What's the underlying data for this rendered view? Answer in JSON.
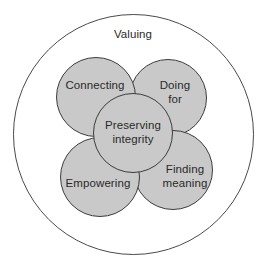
{
  "diagram": {
    "type": "nested-venn",
    "outer": {
      "label": "Valuing",
      "center": [
        133,
        134
      ],
      "radius": 120,
      "fill": "#ffffff",
      "stroke": "#4a4a4a"
    },
    "inner_fill": "#c9c9c9",
    "inner_stroke": "#3c3c3c",
    "text_color": "#2a2a2a",
    "circles": [
      {
        "id": "doing-for",
        "lines": [
          "Doing",
          "for"
        ],
        "center": [
          168,
          98
        ],
        "radius": 39
      },
      {
        "id": "connecting",
        "lines": [
          "Connecting"
        ],
        "center": [
          96,
          97
        ],
        "radius": 40
      },
      {
        "id": "finding-meaning",
        "lines": [
          "Finding",
          "meaning"
        ],
        "center": [
          173,
          170
        ],
        "radius": 40
      },
      {
        "id": "empowering",
        "lines": [
          "Empowering"
        ],
        "center": [
          100,
          177
        ],
        "radius": 40
      },
      {
        "id": "preserving-integrity",
        "lines": [
          "Preserving",
          "integrity"
        ],
        "center": [
          133,
          133
        ],
        "radius": 40
      }
    ]
  }
}
